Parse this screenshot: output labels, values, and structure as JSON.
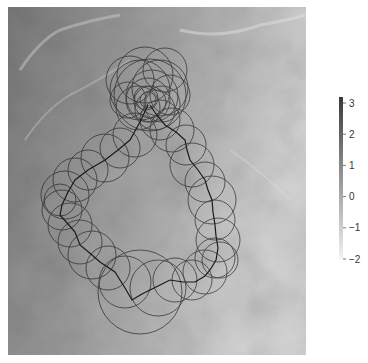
{
  "chart_data": {
    "type": "scatter",
    "title": "",
    "xlabel": "",
    "ylabel": "",
    "image_extent_px": {
      "x0": 8,
      "y0": 7,
      "x1": 306,
      "y1": 355
    },
    "colorbar": {
      "min": -2,
      "max": 3.2,
      "ticks": [
        3,
        2,
        1,
        0,
        -1,
        -2
      ],
      "tick_labels": [
        "3",
        "2",
        "1",
        "0",
        "−1",
        "−2"
      ],
      "colormap": "grayscale (light to dark)",
      "low_color": "#f2f2f2",
      "high_color": "#3a3a3a"
    },
    "path_points": [
      [
        148,
        105
      ],
      [
        140,
        122
      ],
      [
        130,
        140
      ],
      [
        118,
        150
      ],
      [
        105,
        160
      ],
      [
        88,
        170
      ],
      [
        75,
        180
      ],
      [
        68,
        192
      ],
      [
        62,
        205
      ],
      [
        60,
        215
      ],
      [
        68,
        224
      ],
      [
        75,
        232
      ],
      [
        80,
        245
      ],
      [
        92,
        255
      ],
      [
        100,
        262
      ],
      [
        115,
        272
      ],
      [
        125,
        288
      ],
      [
        132,
        300
      ],
      [
        142,
        294
      ],
      [
        150,
        290
      ],
      [
        162,
        284
      ],
      [
        170,
        280
      ],
      [
        183,
        282
      ],
      [
        195,
        282
      ],
      [
        205,
        276
      ],
      [
        210,
        270
      ],
      [
        216,
        260
      ],
      [
        218,
        248
      ],
      [
        216,
        236
      ],
      [
        215,
        225
      ],
      [
        213,
        212
      ],
      [
        212,
        200
      ],
      [
        208,
        190
      ],
      [
        205,
        180
      ],
      [
        198,
        170
      ],
      [
        190,
        160
      ],
      [
        187,
        150
      ],
      [
        185,
        140
      ],
      [
        176,
        132
      ],
      [
        165,
        125
      ],
      [
        156,
        114
      ],
      [
        150,
        105
      ]
    ],
    "circles": [
      {
        "cx": 148,
        "cy": 100,
        "r": 22
      },
      {
        "cx": 150,
        "cy": 102,
        "r": 16
      },
      {
        "cx": 146,
        "cy": 98,
        "r": 12
      },
      {
        "cx": 152,
        "cy": 96,
        "r": 26
      },
      {
        "cx": 140,
        "cy": 90,
        "r": 30
      },
      {
        "cx": 160,
        "cy": 88,
        "r": 28
      },
      {
        "cx": 145,
        "cy": 75,
        "r": 28
      },
      {
        "cx": 165,
        "cy": 70,
        "r": 22
      },
      {
        "cx": 130,
        "cy": 80,
        "r": 24
      },
      {
        "cx": 155,
        "cy": 110,
        "r": 20
      },
      {
        "cx": 138,
        "cy": 108,
        "r": 22
      },
      {
        "cx": 162,
        "cy": 104,
        "r": 18
      },
      {
        "cx": 150,
        "cy": 95,
        "r": 36
      },
      {
        "cx": 148,
        "cy": 100,
        "r": 8
      },
      {
        "cx": 170,
        "cy": 95,
        "r": 20
      },
      {
        "cx": 128,
        "cy": 100,
        "r": 18
      },
      {
        "cx": 135,
        "cy": 135,
        "r": 22
      },
      {
        "cx": 120,
        "cy": 148,
        "r": 20
      },
      {
        "cx": 105,
        "cy": 158,
        "r": 24
      },
      {
        "cx": 88,
        "cy": 170,
        "r": 20
      },
      {
        "cx": 75,
        "cy": 180,
        "r": 22
      },
      {
        "cx": 65,
        "cy": 195,
        "r": 24
      },
      {
        "cx": 62,
        "cy": 210,
        "r": 20
      },
      {
        "cx": 70,
        "cy": 225,
        "r": 22
      },
      {
        "cx": 80,
        "cy": 242,
        "r": 22
      },
      {
        "cx": 92,
        "cy": 255,
        "r": 24
      },
      {
        "cx": 108,
        "cy": 268,
        "r": 22
      },
      {
        "cx": 125,
        "cy": 282,
        "r": 26
      },
      {
        "cx": 140,
        "cy": 292,
        "r": 42
      },
      {
        "cx": 158,
        "cy": 288,
        "r": 28
      },
      {
        "cx": 175,
        "cy": 280,
        "r": 22
      },
      {
        "cx": 192,
        "cy": 280,
        "r": 20
      },
      {
        "cx": 205,
        "cy": 272,
        "r": 22
      },
      {
        "cx": 215,
        "cy": 258,
        "r": 20
      },
      {
        "cx": 218,
        "cy": 240,
        "r": 22
      },
      {
        "cx": 215,
        "cy": 220,
        "r": 20
      },
      {
        "cx": 212,
        "cy": 200,
        "r": 24
      },
      {
        "cx": 205,
        "cy": 182,
        "r": 20
      },
      {
        "cx": 192,
        "cy": 165,
        "r": 22
      },
      {
        "cx": 186,
        "cy": 145,
        "r": 20
      },
      {
        "cx": 172,
        "cy": 130,
        "r": 22
      },
      {
        "cx": 160,
        "cy": 120,
        "r": 20
      },
      {
        "cx": 60,
        "cy": 200,
        "r": 16
      },
      {
        "cx": 220,
        "cy": 260,
        "r": 18
      }
    ]
  }
}
